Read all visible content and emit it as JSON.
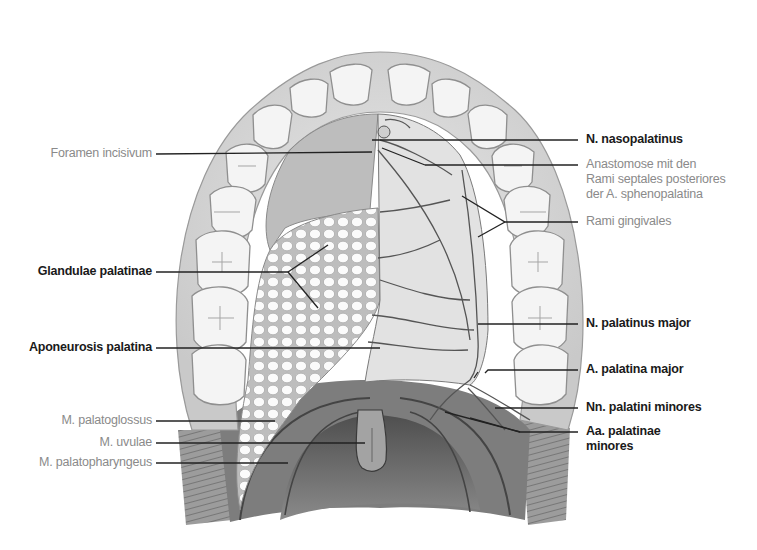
{
  "figure": {
    "colors": {
      "bold_label": "#1a1a1a",
      "light_label": "#8a8a8a",
      "leader_line": "#222222",
      "gingiva": "#dcdcdc",
      "teeth": "#f2f2f2",
      "glands": "#fafafa",
      "muscle": "#8c8c8c",
      "pharynx": "#5e5e5e"
    }
  },
  "labels": {
    "left": [
      {
        "text": "Foramen incisivum",
        "style": "light"
      },
      {
        "text": "Glandulae palatinae",
        "style": "bold"
      },
      {
        "text": "Aponeurosis palatina",
        "style": "bold"
      },
      {
        "text": "M. palatoglossus",
        "style": "light"
      },
      {
        "text": "M. uvulae",
        "style": "light"
      },
      {
        "text": "M. palatopharyngeus",
        "style": "light"
      }
    ],
    "right": [
      {
        "text": "N. nasopalatinus",
        "style": "bold"
      },
      {
        "text": "Anastomose mit den\nRami septales posteriores\nder A. sphenopalatina",
        "style": "light"
      },
      {
        "text": "Rami gingivales",
        "style": "light"
      },
      {
        "text": "N. palatinus major",
        "style": "bold"
      },
      {
        "text": "A. palatina major",
        "style": "bold"
      },
      {
        "text": "Nn. palatini minores",
        "style": "bold"
      },
      {
        "text": "Aa. palatinae\nminores",
        "style": "bold"
      }
    ]
  }
}
